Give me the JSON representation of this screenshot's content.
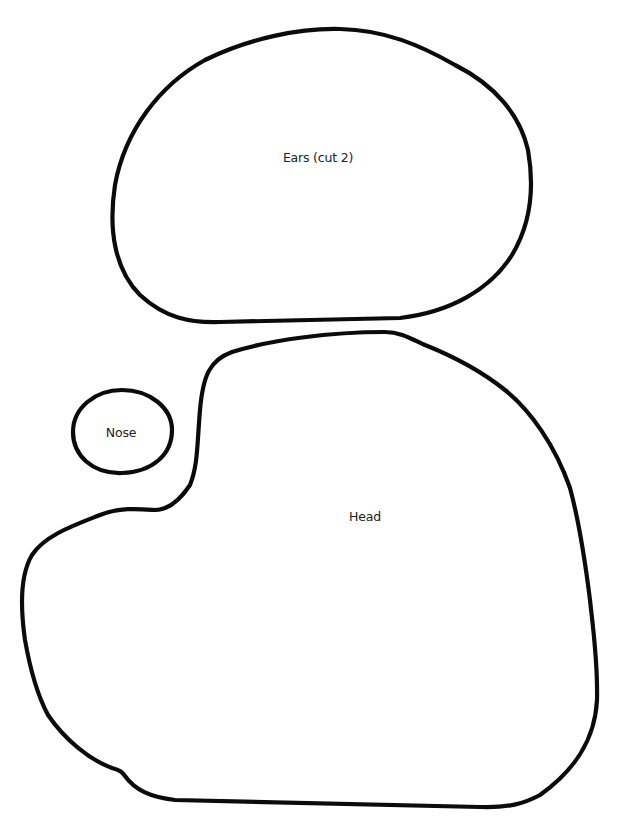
{
  "pattern": {
    "pieces": [
      {
        "id": "ears",
        "label": "Ears (cut 2)",
        "label_pos": [
          318,
          157
        ]
      },
      {
        "id": "nose",
        "label": "Nose",
        "label_pos": [
          121,
          432
        ]
      },
      {
        "id": "head",
        "label": "Head",
        "label_pos": [
          365,
          516
        ]
      }
    ],
    "colors": {
      "background": "#ffffff",
      "outline": "#0b0b0b",
      "text": "#222222"
    }
  }
}
